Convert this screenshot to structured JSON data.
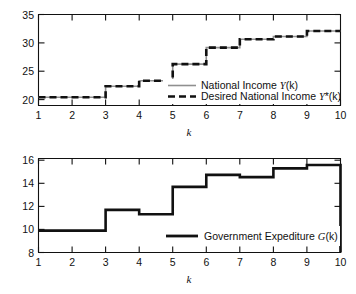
{
  "figure": {
    "background": "#ffffff",
    "line_color_solid": "#8f8f8f",
    "line_color_dashed": "#111111"
  },
  "chart_data": [
    {
      "type": "line",
      "panel": "top",
      "title": "",
      "xlabel": "k",
      "ylabel": "",
      "xlim": [
        1,
        10
      ],
      "ylim": [
        18.5,
        35
      ],
      "xticks": [
        1,
        2,
        3,
        4,
        5,
        6,
        7,
        8,
        9,
        10
      ],
      "xticklabels": [
        "1",
        "2",
        "3",
        "4",
        "5",
        "6",
        "7",
        "8",
        "9",
        "10"
      ],
      "yticks": [
        20,
        25,
        30,
        35
      ],
      "yticklabels": [
        "20",
        "25",
        "30",
        "35"
      ],
      "grid": false,
      "drawstyle": "steps-post",
      "legend_position": "center-right",
      "x": [
        1,
        2,
        3,
        4,
        5,
        6,
        7,
        8,
        9,
        10
      ],
      "series": [
        {
          "name": "National Income Y(k)",
          "name_plain": "National Income ",
          "name_italic": "Y",
          "name_tail": "(k)",
          "style": "solid",
          "color": "#8f8f8f",
          "values": [
            20,
            20,
            22,
            23,
            26,
            29,
            30.5,
            31,
            32,
            32
          ]
        },
        {
          "name": "Desired National Income Y*(k)",
          "name_plain": "Desired National Income ",
          "name_italic": "Y",
          "name_tail": "*(k)",
          "style": "dashed",
          "color": "#111111",
          "values": [
            20,
            20,
            22,
            23,
            26,
            29,
            30.5,
            31,
            32,
            32
          ]
        }
      ]
    },
    {
      "type": "line",
      "panel": "bottom",
      "title": "",
      "xlabel": "k",
      "ylabel": "",
      "xlim": [
        1,
        10
      ],
      "ylim": [
        8,
        16.6
      ],
      "xticks": [
        1,
        2,
        3,
        4,
        5,
        6,
        7,
        8,
        9,
        10
      ],
      "xticklabels": [
        "1",
        "2",
        "3",
        "4",
        "5",
        "6",
        "7",
        "8",
        "9",
        "10"
      ],
      "yticks": [
        8,
        10,
        12,
        14,
        16
      ],
      "yticklabels": [
        "8",
        "10",
        "12",
        "14",
        "16"
      ],
      "grid": false,
      "drawstyle": "steps-post",
      "legend_position": "lower-right",
      "x": [
        1,
        2,
        3,
        4,
        5,
        6,
        7,
        8,
        9,
        10
      ],
      "series": [
        {
          "name": "Government Expediture G(k)",
          "name_plain": "Government Expediture ",
          "name_italic": "G",
          "name_tail": "(k)",
          "style": "thick",
          "color": "#111111",
          "values": [
            10,
            10,
            11.9,
            11.5,
            14,
            15.1,
            14.9,
            15.7,
            16,
            16
          ]
        }
      ]
    }
  ]
}
